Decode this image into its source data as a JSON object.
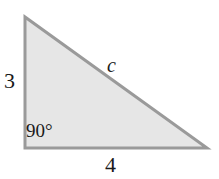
{
  "figure": {
    "kind": "right-triangle-diagram",
    "background_color": "#ffffff",
    "fill_color": "#e6e6e6",
    "stroke_color": "#9a9a9a",
    "text_color": "#1a1a1a",
    "vertices": {
      "top_left": [
        25,
        17
      ],
      "bottom_left": [
        25,
        148
      ],
      "bottom_right": [
        207,
        148
      ]
    },
    "labels": {
      "leg_vertical": "3",
      "leg_horizontal": "4",
      "hypotenuse": "c",
      "right_angle": "90°"
    }
  },
  "chart_data": {
    "type": "diagram",
    "title": "",
    "shape": "right triangle",
    "annotations": [
      {
        "name": "vertical-leg",
        "text": "3",
        "value": 3,
        "position": "left"
      },
      {
        "name": "horizontal-leg",
        "text": "4",
        "value": 4,
        "position": "bottom"
      },
      {
        "name": "hypotenuse",
        "text": "c",
        "value": null,
        "position": "upper-right"
      },
      {
        "name": "right-angle",
        "text": "90°",
        "value": 90,
        "position": "interior-bottom-left"
      }
    ]
  }
}
